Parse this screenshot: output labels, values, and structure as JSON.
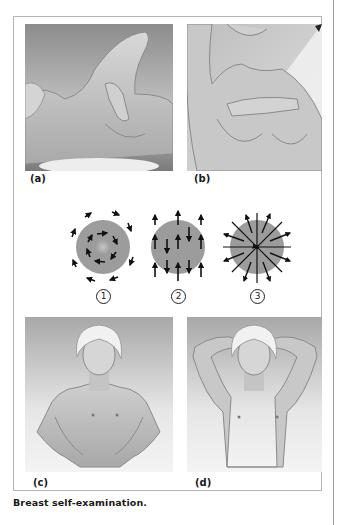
{
  "figure": {
    "caption": "Breast self-examination.",
    "panels": [
      {
        "id": "a",
        "label": "(a)",
        "description": "Woman lying down examining breast with hand, arm raised"
      },
      {
        "id": "b",
        "label": "(b)",
        "description": "Woman in shower examining breast with arm raised"
      },
      {
        "id": "c",
        "label": "(c)",
        "description": "Woman standing with hands on hips"
      },
      {
        "id": "d",
        "label": "(d)",
        "description": "Woman standing with hands behind head"
      }
    ],
    "patterns": [
      {
        "number": "1",
        "name": "circular"
      },
      {
        "number": "2",
        "name": "vertical strip"
      },
      {
        "number": "3",
        "name": "radial wedge"
      }
    ]
  },
  "colors": {
    "circle_fill": "#9a9a9a",
    "arrow": "#111111",
    "frame": "#b5b5b5",
    "skin": "#c9c9c9"
  }
}
